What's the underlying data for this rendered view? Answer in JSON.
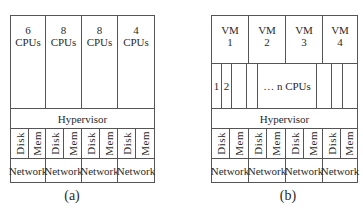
{
  "panel_a": {
    "cpu_groups": [
      {
        "count": "6",
        "unit": "CPUs"
      },
      {
        "count": "8",
        "unit": "CPUs"
      },
      {
        "count": "8",
        "unit": "CPUs"
      },
      {
        "count": "4",
        "unit": "CPUs"
      }
    ],
    "hypervisor": "Hypervisor",
    "resources": [
      {
        "disk": "Disk",
        "mem": "Mem",
        "network": "Network"
      },
      {
        "disk": "Disk",
        "mem": "Mem",
        "network": "Network"
      },
      {
        "disk": "Disk",
        "mem": "Mem",
        "network": "Network"
      },
      {
        "disk": "Disk",
        "mem": "Mem",
        "network": "Network"
      }
    ],
    "caption": "(a)"
  },
  "panel_b": {
    "vms": [
      {
        "name": "VM",
        "id": "1"
      },
      {
        "name": "VM",
        "id": "2"
      },
      {
        "name": "VM",
        "id": "3"
      },
      {
        "name": "VM",
        "id": "4"
      }
    ],
    "cpu_labels": {
      "first": "1",
      "second": "2",
      "rest": "… n CPUs"
    },
    "hypervisor": "Hypervisor",
    "resources": [
      {
        "disk": "Disk",
        "mem": "Mem",
        "network": "Network"
      },
      {
        "disk": "Disk",
        "mem": "Mem",
        "network": "Network"
      },
      {
        "disk": "Disk",
        "mem": "Mem",
        "network": "Network"
      },
      {
        "disk": "Disk",
        "mem": "Mem",
        "network": "Network"
      }
    ],
    "caption": "(b)"
  }
}
